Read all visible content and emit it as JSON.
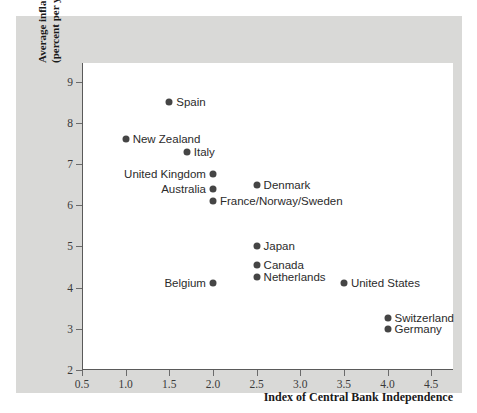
{
  "chart_data": {
    "type": "scatter",
    "title": "",
    "xlabel": "Index of Central Bank Independence",
    "ylabel_line1": "Average inflation",
    "ylabel_line2": "(percent per year)",
    "xlim": [
      0.5,
      4.75
    ],
    "ylim": [
      2,
      9.45
    ],
    "xticks": [
      0.5,
      1.0,
      1.5,
      2.0,
      2.5,
      3.0,
      3.5,
      4.0,
      4.5
    ],
    "xtick_labels": [
      "0.5",
      "1.0",
      "1.5",
      "2.0",
      "2.5",
      "3.0",
      "3.5",
      "4.0",
      "4.5"
    ],
    "yticks": [
      2,
      3,
      4,
      5,
      6,
      7,
      8,
      9
    ],
    "ytick_labels": [
      "2",
      "3",
      "4",
      "5",
      "6",
      "7",
      "8",
      "9"
    ],
    "grid": false,
    "legend": "none",
    "marker_color": "#454545",
    "points": [
      {
        "label": "Spain",
        "x": 1.5,
        "y": 8.5,
        "label_side": "right"
      },
      {
        "label": "New Zealand",
        "x": 1.0,
        "y": 7.6,
        "label_side": "right"
      },
      {
        "label": "Italy",
        "x": 1.7,
        "y": 7.3,
        "label_side": "right"
      },
      {
        "label": "United Kingdom",
        "x": 2.0,
        "y": 6.75,
        "label_side": "left"
      },
      {
        "label": "Australia",
        "x": 2.0,
        "y": 6.4,
        "label_side": "left"
      },
      {
        "label": "Denmark",
        "x": 2.5,
        "y": 6.5,
        "label_side": "right"
      },
      {
        "label": "France/Norway/Sweden",
        "x": 2.0,
        "y": 6.1,
        "label_side": "right"
      },
      {
        "label": "Japan",
        "x": 2.5,
        "y": 5.0,
        "label_side": "right"
      },
      {
        "label": "Canada",
        "x": 2.5,
        "y": 4.55,
        "label_side": "right"
      },
      {
        "label": "Netherlands",
        "x": 2.5,
        "y": 4.25,
        "label_side": "right"
      },
      {
        "label": "Belgium",
        "x": 2.0,
        "y": 4.1,
        "label_side": "left"
      },
      {
        "label": "United States",
        "x": 3.5,
        "y": 4.1,
        "label_side": "right"
      },
      {
        "label": "Switzerland",
        "x": 4.0,
        "y": 3.25,
        "label_side": "right"
      },
      {
        "label": "Germany",
        "x": 4.0,
        "y": 3.0,
        "label_side": "right"
      }
    ]
  },
  "colors": {
    "page_background": "#ffffff",
    "panel_background": "#d9d9d7",
    "plot_background": "#ffffff",
    "axis_line": "#5a5a5a",
    "marker": "#454545",
    "text": "#1a1a1a"
  }
}
